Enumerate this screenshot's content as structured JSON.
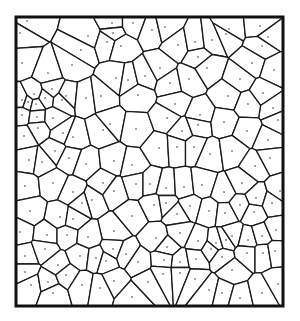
{
  "diagram": {
    "type": "voronoi",
    "frame": {
      "x": 16,
      "y": 17,
      "width": 267,
      "height": 289
    },
    "colors": {
      "background": "#ffffff",
      "edge": "#1a1a1a",
      "frame": "#111111",
      "seed": "#333333"
    },
    "edge_width": 1.3,
    "frame_width": 3,
    "seed_radius": 0.8,
    "seeds": [
      [
        27,
        21
      ],
      [
        20,
        33
      ],
      [
        88,
        36
      ],
      [
        81,
        50
      ],
      [
        112,
        23
      ],
      [
        107,
        42
      ],
      [
        113,
        33
      ],
      [
        121,
        46
      ],
      [
        133,
        23
      ],
      [
        152,
        30
      ],
      [
        165,
        27
      ],
      [
        178,
        45
      ],
      [
        195,
        42
      ],
      [
        198,
        57
      ],
      [
        212,
        40
      ],
      [
        226,
        34
      ],
      [
        229,
        29
      ],
      [
        260,
        26
      ],
      [
        268,
        37
      ],
      [
        262,
        46
      ],
      [
        22,
        63
      ],
      [
        48,
        73
      ],
      [
        72,
        65
      ],
      [
        116,
        78
      ],
      [
        128,
        80
      ],
      [
        145,
        76
      ],
      [
        160,
        68
      ],
      [
        170,
        83
      ],
      [
        189,
        79
      ],
      [
        207,
        68
      ],
      [
        240,
        79
      ],
      [
        252,
        63
      ],
      [
        274,
        70
      ],
      [
        22,
        100
      ],
      [
        28,
        102
      ],
      [
        36,
        104
      ],
      [
        45,
        98
      ],
      [
        34,
        94
      ],
      [
        52,
        89
      ],
      [
        62,
        100
      ],
      [
        66,
        96
      ],
      [
        86,
        98
      ],
      [
        101,
        96
      ],
      [
        138,
        95
      ],
      [
        175,
        104
      ],
      [
        200,
        115
      ],
      [
        228,
        96
      ],
      [
        263,
        93
      ],
      [
        273,
        108
      ],
      [
        278,
        120
      ],
      [
        22,
        115
      ],
      [
        37,
        117
      ],
      [
        53,
        118
      ],
      [
        38,
        128
      ],
      [
        63,
        133
      ],
      [
        24,
        136
      ],
      [
        55,
        151
      ],
      [
        73,
        137
      ],
      [
        103,
        130
      ],
      [
        110,
        124
      ],
      [
        136,
        129
      ],
      [
        167,
        118
      ],
      [
        182,
        131
      ],
      [
        198,
        125
      ],
      [
        224,
        122
      ],
      [
        248,
        104
      ],
      [
        247,
        131
      ],
      [
        268,
        140
      ],
      [
        29,
        160
      ],
      [
        42,
        162
      ],
      [
        69,
        158
      ],
      [
        86,
        164
      ],
      [
        114,
        161
      ],
      [
        132,
        165
      ],
      [
        159,
        148
      ],
      [
        177,
        147
      ],
      [
        194,
        147
      ],
      [
        210,
        154
      ],
      [
        232,
        151
      ],
      [
        255,
        166
      ],
      [
        270,
        158
      ],
      [
        25,
        186
      ],
      [
        53,
        183
      ],
      [
        73,
        192
      ],
      [
        92,
        200
      ],
      [
        103,
        183
      ],
      [
        114,
        191
      ],
      [
        136,
        184
      ],
      [
        150,
        184
      ],
      [
        166,
        188
      ],
      [
        184,
        187
      ],
      [
        202,
        185
      ],
      [
        224,
        192
      ],
      [
        242,
        183
      ],
      [
        256,
        198
      ],
      [
        280,
        191
      ],
      [
        30,
        211
      ],
      [
        60,
        217
      ],
      [
        73,
        219
      ],
      [
        82,
        203
      ],
      [
        114,
        231
      ],
      [
        132,
        216
      ],
      [
        154,
        205
      ],
      [
        166,
        203
      ],
      [
        177,
        214
      ],
      [
        190,
        206
      ],
      [
        209,
        211
      ],
      [
        225,
        213
      ],
      [
        240,
        205
      ],
      [
        254,
        212
      ],
      [
        272,
        203
      ],
      [
        20,
        232
      ],
      [
        47,
        235
      ],
      [
        67,
        235
      ],
      [
        88,
        237
      ],
      [
        113,
        249
      ],
      [
        126,
        254
      ],
      [
        156,
        238
      ],
      [
        167,
        247
      ],
      [
        180,
        233
      ],
      [
        198,
        241
      ],
      [
        216,
        243
      ],
      [
        226,
        240
      ],
      [
        232,
        236
      ],
      [
        248,
        240
      ],
      [
        262,
        236
      ],
      [
        276,
        230
      ],
      [
        25,
        256
      ],
      [
        45,
        249
      ],
      [
        58,
        265
      ],
      [
        80,
        256
      ],
      [
        96,
        258
      ],
      [
        106,
        261
      ],
      [
        138,
        262
      ],
      [
        164,
        260
      ],
      [
        180,
        262
      ],
      [
        196,
        259
      ],
      [
        211,
        249
      ],
      [
        222,
        257
      ],
      [
        232,
        270
      ],
      [
        247,
        253
      ],
      [
        263,
        253
      ],
      [
        275,
        251
      ],
      [
        25,
        272
      ],
      [
        31,
        285
      ],
      [
        48,
        282
      ],
      [
        53,
        293
      ],
      [
        66,
        275
      ],
      [
        82,
        285
      ],
      [
        100,
        288
      ],
      [
        114,
        281
      ],
      [
        132,
        297
      ],
      [
        148,
        282
      ],
      [
        163,
        274
      ],
      [
        180,
        273
      ],
      [
        195,
        279
      ],
      [
        209,
        290
      ],
      [
        222,
        293
      ],
      [
        240,
        298
      ],
      [
        262,
        293
      ],
      [
        278,
        284
      ]
    ]
  }
}
